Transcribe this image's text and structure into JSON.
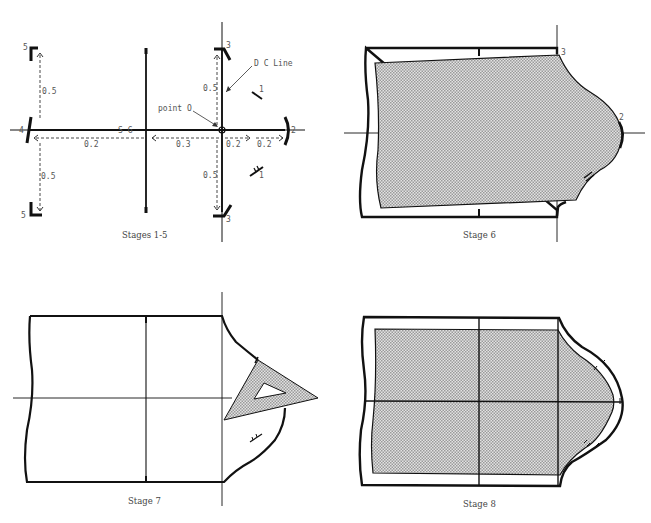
{
  "figure": {
    "panels": [
      {
        "id": "stages-1-5",
        "caption": "Stages 1-5",
        "labels": {
          "dc_line": "D C Line",
          "point_o": "point O",
          "sg": "S G",
          "num_1a": "1",
          "num_1b": "1",
          "num_2": "2",
          "num_3a": "3",
          "num_3b": "3",
          "num_4": "4",
          "num_5a": "5",
          "num_5b": "5"
        },
        "measurements": {
          "up_left": "0.5",
          "down_left": "0.5",
          "left_horiz": "0.2",
          "mid_horiz": "0.3",
          "right_horiz_1": "0.2",
          "right_horiz_2": "0.2",
          "up_right": "0.5",
          "down_right": "0.5"
        }
      },
      {
        "id": "stage-6",
        "caption": "Stage 6",
        "labels": {
          "num_2": "2",
          "num_3": "3"
        }
      },
      {
        "id": "stage-7",
        "caption": "Stage 7"
      },
      {
        "id": "stage-8",
        "caption": "Stage 8"
      }
    ],
    "colors": {
      "line": "#111111",
      "fill": "#c8c8c8",
      "text": "#555555"
    }
  }
}
